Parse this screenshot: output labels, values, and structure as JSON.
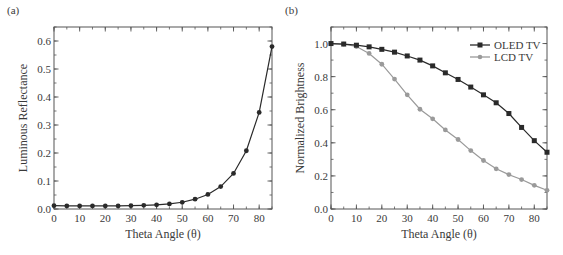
{
  "chart_data": [
    {
      "panel_label": "(a)",
      "type": "line",
      "title": "",
      "xlabel": "Theta Angle (θ)",
      "ylabel": "Luminous Reflectance",
      "xlim": [
        0,
        85
      ],
      "ylim": [
        0,
        0.65
      ],
      "xticks": [
        0,
        10,
        20,
        30,
        40,
        50,
        60,
        70,
        80
      ],
      "xtick_labels": [
        "0",
        "10",
        "20",
        "30",
        "40",
        "50",
        "60",
        "70",
        "80"
      ],
      "yticks": [
        0.0,
        0.1,
        0.2,
        0.3,
        0.4,
        0.5,
        0.6
      ],
      "ytick_labels": [
        "0.0",
        "0.1",
        "0.2",
        "0.3",
        "0.4",
        "0.5",
        "0.6"
      ],
      "grid": false,
      "legend": null,
      "x": [
        0,
        5,
        10,
        15,
        20,
        25,
        30,
        35,
        40,
        45,
        50,
        55,
        60,
        65,
        70,
        75,
        80,
        85
      ],
      "series": [
        {
          "name": "Luminous Reflectance",
          "color": "#2a2a2a",
          "marker": "circle",
          "values": [
            0.012,
            0.011,
            0.011,
            0.011,
            0.011,
            0.011,
            0.012,
            0.013,
            0.015,
            0.018,
            0.024,
            0.035,
            0.052,
            0.08,
            0.127,
            0.208,
            0.345,
            0.58
          ]
        }
      ]
    },
    {
      "panel_label": "(b)",
      "type": "line",
      "title": "",
      "xlabel": "Theta Angle (θ)",
      "ylabel": "Normalized Brightness",
      "xlim": [
        0,
        85
      ],
      "ylim": [
        0,
        1.1
      ],
      "xticks": [
        0,
        10,
        20,
        30,
        40,
        50,
        60,
        70,
        80
      ],
      "xtick_labels": [
        "0",
        "10",
        "20",
        "30",
        "40",
        "50",
        "60",
        "70",
        "80"
      ],
      "yticks": [
        0.0,
        0.2,
        0.4,
        0.6,
        0.8,
        1.0
      ],
      "ytick_labels": [
        "0.0",
        "0.2",
        "0.4",
        "0.6",
        "0.8",
        "1.0"
      ],
      "grid": false,
      "legend_position": "upper right",
      "x": [
        0,
        5,
        10,
        15,
        20,
        25,
        30,
        35,
        40,
        45,
        50,
        55,
        60,
        65,
        70,
        75,
        80,
        85
      ],
      "series": [
        {
          "name": "OLED TV",
          "color": "#2a2a2a",
          "marker": "square",
          "values": [
            1.0,
            0.997,
            0.99,
            0.98,
            0.965,
            0.948,
            0.925,
            0.9,
            0.865,
            0.823,
            0.783,
            0.737,
            0.69,
            0.642,
            0.577,
            0.493,
            0.413,
            0.343
          ]
        },
        {
          "name": "LCD TV",
          "color": "#9a9a9a",
          "marker": "circle",
          "values": [
            1.0,
            0.997,
            0.982,
            0.94,
            0.875,
            0.785,
            0.69,
            0.603,
            0.545,
            0.478,
            0.42,
            0.353,
            0.293,
            0.243,
            0.208,
            0.178,
            0.143,
            0.113
          ]
        }
      ]
    }
  ]
}
